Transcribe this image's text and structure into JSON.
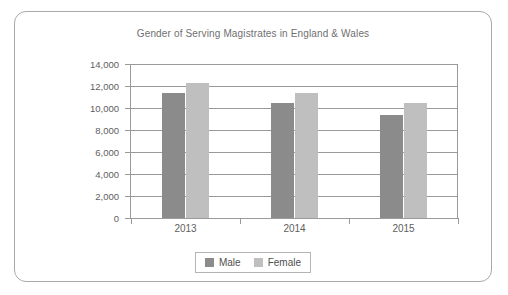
{
  "chart_data": {
    "type": "bar",
    "title": "Gender of Serving Magistrates in England & Wales",
    "xlabel": "",
    "ylabel": "",
    "categories": [
      "2013",
      "2014",
      "2015"
    ],
    "series": [
      {
        "name": "Male",
        "color": "#8b8b8b",
        "values": [
          11350,
          10450,
          9400
        ]
      },
      {
        "name": "Female",
        "color": "#bfbfbf",
        "values": [
          12250,
          11400,
          10500
        ]
      }
    ],
    "ylim": [
      0,
      14000
    ],
    "ytick_values": [
      14000,
      12000,
      10000,
      8000,
      6000,
      4000,
      2000,
      0
    ],
    "ytick_labels": [
      "14,000",
      "12,000",
      "10,000",
      "8,000",
      "6,000",
      "4,000",
      "2,000",
      "0"
    ],
    "grid": true,
    "legend_position": "bottom",
    "legend_entries": [
      "Male",
      "Female"
    ]
  },
  "frame": {
    "border_color": "#a9a9a9",
    "background": "#ffffff"
  }
}
